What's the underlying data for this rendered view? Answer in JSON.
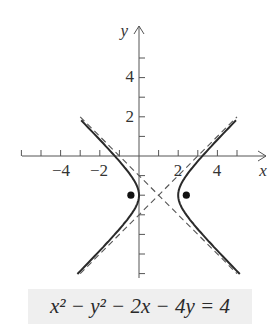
{
  "figure": {
    "equation": "x² − y² − 2x − 4y = 4",
    "axis_labels": {
      "x": "x",
      "y": "y"
    },
    "x_tick_labels": [
      "−4",
      "−2",
      "2",
      "4"
    ],
    "y_tick_labels": [
      "4",
      "2"
    ],
    "colors": {
      "curve": "#2a2a2a",
      "asymptote": "#555555",
      "axis": "#555555",
      "caption_bg": "#efefef"
    }
  },
  "chart_data": {
    "type": "line",
    "title": "x² − y² − 2x − 4y = 4",
    "xlabel": "x",
    "ylabel": "y",
    "xlim": [
      -6,
      6
    ],
    "ylim": [
      -6,
      6
    ],
    "x_ticks": [
      -6,
      -5,
      -4,
      -3,
      -2,
      -1,
      1,
      2,
      3,
      4,
      5
    ],
    "y_ticks": [
      -6,
      -5,
      -4,
      -3,
      -2,
      -1,
      1,
      2,
      3,
      4,
      5
    ],
    "x_tick_labels": {
      "-4": "−4",
      "-2": "−2",
      "2": "2",
      "4": "4"
    },
    "y_tick_labels": {
      "2": "2",
      "4": "4"
    },
    "grid": false,
    "series": [
      {
        "name": "hyperbola",
        "style": "solid",
        "equation": "(x-1)^2 - (y+2)^2 = 1",
        "center": [
          1,
          -2
        ],
        "vertices": [
          [
            0,
            -2
          ],
          [
            2,
            -2
          ]
        ]
      },
      {
        "name": "asymptote 1",
        "style": "dashed",
        "equation": "y = x - 3"
      },
      {
        "name": "asymptote 2",
        "style": "dashed",
        "equation": "y = -x - 1"
      },
      {
        "name": "foci",
        "style": "points",
        "points": [
          [
            -0.414,
            -2
          ],
          [
            2.414,
            -2
          ]
        ]
      }
    ]
  }
}
